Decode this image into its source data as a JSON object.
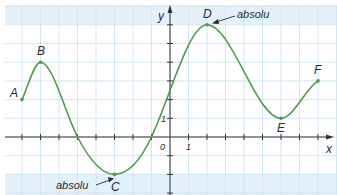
{
  "chart_data": {
    "type": "line",
    "title": "",
    "xlabel": "x",
    "ylabel": "y",
    "xlim": [
      -8.5,
      8.8
    ],
    "ylim": [
      -3,
      7
    ],
    "grid": true,
    "origin_label": "0",
    "x_unit_label": "1",
    "y_unit_label": "1",
    "points": [
      {
        "name": "A",
        "x": -8,
        "y": 2
      },
      {
        "name": "B",
        "x": -7,
        "y": 4
      },
      {
        "name": "C",
        "x": -3,
        "y": -2
      },
      {
        "name": "D",
        "x": 2,
        "y": 6
      },
      {
        "name": "E",
        "x": 6,
        "y": 1
      },
      {
        "name": "F",
        "x": 8,
        "y": 3
      }
    ],
    "x_intercepts": [
      -5,
      -1
    ],
    "annotations": [
      {
        "text": "absolu",
        "target": "D",
        "meaning": "absolute maximum"
      },
      {
        "text": "absolu",
        "target": "C",
        "meaning": "absolute minimum"
      }
    ],
    "colors": {
      "curve": "#4f9a4a",
      "grid": "#cfe6f3",
      "band": "#e3f1fa",
      "axis": "#333333"
    }
  }
}
